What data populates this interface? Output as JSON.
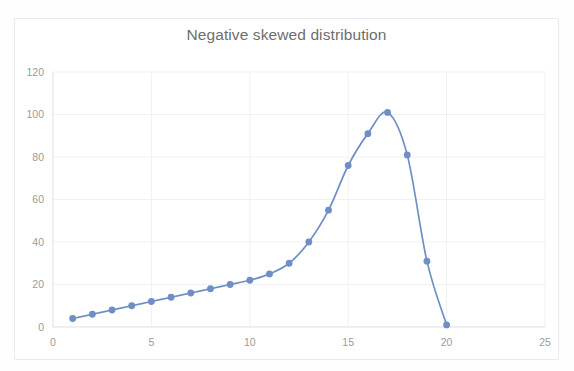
{
  "chart_data": {
    "type": "line",
    "title": "Negative skewed distribution",
    "xlabel": "",
    "ylabel": "",
    "xlim": [
      0,
      25
    ],
    "ylim": [
      0,
      120
    ],
    "grid": true,
    "legend": false,
    "legend_position": "none",
    "marker": "circle",
    "smoothed": true,
    "series_color": "#6f8fc4",
    "x": [
      1,
      2,
      3,
      4,
      5,
      6,
      7,
      8,
      9,
      10,
      11,
      12,
      13,
      14,
      15,
      16,
      17,
      18,
      19,
      20
    ],
    "values": [
      4,
      6,
      8,
      10,
      12,
      14,
      16,
      18,
      20,
      22,
      25,
      30,
      40,
      55,
      76,
      91,
      101,
      81,
      31,
      1
    ],
    "series": [
      {
        "name": "Negative skewed distribution",
        "color": "#6f8fc4",
        "values": [
          4,
          6,
          8,
          10,
          12,
          14,
          16,
          18,
          20,
          22,
          25,
          30,
          40,
          55,
          76,
          91,
          101,
          81,
          31,
          1
        ]
      }
    ],
    "x_tick_labels": [
      "0",
      "5",
      "10",
      "15",
      "20",
      "25"
    ],
    "x_tick_values": [
      0,
      5,
      10,
      15,
      20,
      25
    ],
    "y_tick_labels": [
      "0",
      "20",
      "40",
      "60",
      "80",
      "100",
      "120"
    ],
    "y_tick_values": [
      0,
      20,
      40,
      60,
      80,
      100,
      120
    ]
  },
  "colors": {
    "series": "#6f8fc4",
    "gridline": "#f0f1f4",
    "axis": "#e3e5ea",
    "title_text": "#6e6e6e",
    "tick_text": "#9a9a9a",
    "frame_border": "#e9ebef",
    "background": "#ffffff"
  }
}
